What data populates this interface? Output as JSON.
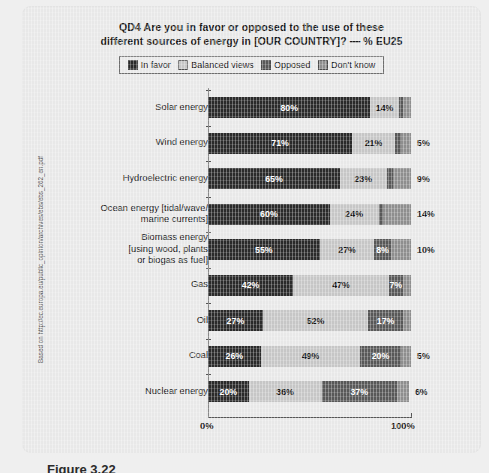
{
  "source_note": "Based on http://ec.europa.eu/public_opinion/archives/ebs/ebs_262_en.pdf",
  "figure_caption": "Figure 3.22",
  "title": {
    "line1": "QD4 Are you in favor or opposed to the use of these",
    "line2": "different sources of energy in [OUR COUNTRY]? — % EU25"
  },
  "legend": [
    {
      "label": "In favor",
      "color": "#2a2a2a"
    },
    {
      "label": "Balanced views",
      "color": "#c6c6c6"
    },
    {
      "label": "Opposed",
      "color": "#585858"
    },
    {
      "label": "Don't know",
      "color": "#8e8e8e"
    }
  ],
  "axis": {
    "min_label": "0%",
    "max_label": "100%"
  },
  "chart_data": {
    "type": "bar",
    "orientation": "horizontal",
    "stacked": true,
    "title": "QD4 Are you in favor or opposed to the use of these different sources of energy in [OUR COUNTRY]? — % EU25",
    "xlabel": "",
    "ylabel": "",
    "xlim": [
      0,
      100
    ],
    "grid": false,
    "legend_position": "top",
    "categories": [
      "Solar energy",
      "Wind energy",
      "Hydroelectric energy",
      "Ocean energy [tidal/wave/ marine currents]",
      "Biomass energy [using wood, plants or biogas as fuel]",
      "Gas",
      "Oil",
      "Coal",
      "Nuclear energy"
    ],
    "series": [
      {
        "name": "In favor",
        "values": [
          80,
          71,
          65,
          60,
          55,
          42,
          27,
          26,
          20
        ]
      },
      {
        "name": "Balanced views",
        "values": [
          14,
          21,
          23,
          24,
          27,
          47,
          52,
          49,
          36
        ]
      },
      {
        "name": "Opposed",
        "values": [
          2,
          3,
          3,
          2,
          8,
          7,
          17,
          20,
          37
        ]
      },
      {
        "name": "Don't know",
        "values": [
          4,
          5,
          9,
          14,
          10,
          4,
          4,
          5,
          6
        ]
      }
    ]
  },
  "rows": [
    {
      "label_lines": [
        "Solar energy"
      ],
      "segments": [
        {
          "key": "in_favor",
          "value": 80,
          "label": "80%",
          "show": true,
          "text_color": "#ffffff"
        },
        {
          "key": "balanced_views",
          "value": 14,
          "label": "14%",
          "show": true,
          "text_color": "#141414"
        },
        {
          "key": "opposed",
          "value": 2,
          "label": "2%",
          "show": false,
          "text_color": "#ffffff"
        },
        {
          "key": "dont_know",
          "value": 4,
          "label": "4%",
          "show": false,
          "text_color": "#141414"
        }
      ],
      "outside_label": ""
    },
    {
      "label_lines": [
        "Wind energy"
      ],
      "segments": [
        {
          "key": "in_favor",
          "value": 71,
          "label": "71%",
          "show": true,
          "text_color": "#ffffff"
        },
        {
          "key": "balanced_views",
          "value": 21,
          "label": "21%",
          "show": true,
          "text_color": "#141414"
        },
        {
          "key": "opposed",
          "value": 3,
          "label": "3%",
          "show": false,
          "text_color": "#ffffff"
        },
        {
          "key": "dont_know",
          "value": 5,
          "label": "5%",
          "show": false,
          "text_color": "#141414"
        }
      ],
      "outside_label": "5%"
    },
    {
      "label_lines": [
        "Hydroelectric energy"
      ],
      "segments": [
        {
          "key": "in_favor",
          "value": 65,
          "label": "65%",
          "show": true,
          "text_color": "#ffffff"
        },
        {
          "key": "balanced_views",
          "value": 23,
          "label": "23%",
          "show": true,
          "text_color": "#141414"
        },
        {
          "key": "opposed",
          "value": 3,
          "label": "3%",
          "show": false,
          "text_color": "#ffffff"
        },
        {
          "key": "dont_know",
          "value": 9,
          "label": "9%",
          "show": false,
          "text_color": "#141414"
        }
      ],
      "outside_label": "9%"
    },
    {
      "label_lines": [
        "Ocean energy [tidal/wave/",
        "marine currents]"
      ],
      "segments": [
        {
          "key": "in_favor",
          "value": 60,
          "label": "60%",
          "show": true,
          "text_color": "#ffffff"
        },
        {
          "key": "balanced_views",
          "value": 24,
          "label": "24%",
          "show": true,
          "text_color": "#141414"
        },
        {
          "key": "opposed",
          "value": 2,
          "label": "2%",
          "show": false,
          "text_color": "#ffffff"
        },
        {
          "key": "dont_know",
          "value": 14,
          "label": "14%",
          "show": false,
          "text_color": "#141414"
        }
      ],
      "outside_label": "14%"
    },
    {
      "label_lines": [
        "Biomass energy",
        "[using wood, plants",
        "or biogas as fuel]"
      ],
      "segments": [
        {
          "key": "in_favor",
          "value": 55,
          "label": "55%",
          "show": true,
          "text_color": "#ffffff"
        },
        {
          "key": "balanced_views",
          "value": 27,
          "label": "27%",
          "show": true,
          "text_color": "#141414"
        },
        {
          "key": "opposed",
          "value": 8,
          "label": "8%",
          "show": true,
          "text_color": "#ffffff"
        },
        {
          "key": "dont_know",
          "value": 10,
          "label": "10%",
          "show": false,
          "text_color": "#141414"
        }
      ],
      "outside_label": "10%"
    },
    {
      "label_lines": [
        "Gas"
      ],
      "segments": [
        {
          "key": "in_favor",
          "value": 42,
          "label": "42%",
          "show": true,
          "text_color": "#ffffff"
        },
        {
          "key": "balanced_views",
          "value": 47,
          "label": "47%",
          "show": true,
          "text_color": "#141414"
        },
        {
          "key": "opposed",
          "value": 7,
          "label": "7%",
          "show": true,
          "text_color": "#ffffff"
        },
        {
          "key": "dont_know",
          "value": 4,
          "label": "4%",
          "show": false,
          "text_color": "#141414"
        }
      ],
      "outside_label": ""
    },
    {
      "label_lines": [
        "Oil"
      ],
      "segments": [
        {
          "key": "in_favor",
          "value": 27,
          "label": "27%",
          "show": true,
          "text_color": "#ffffff"
        },
        {
          "key": "balanced_views",
          "value": 52,
          "label": "52%",
          "show": true,
          "text_color": "#141414"
        },
        {
          "key": "opposed",
          "value": 17,
          "label": "17%",
          "show": true,
          "text_color": "#ffffff"
        },
        {
          "key": "dont_know",
          "value": 4,
          "label": "4%",
          "show": false,
          "text_color": "#141414"
        }
      ],
      "outside_label": ""
    },
    {
      "label_lines": [
        "Coal"
      ],
      "segments": [
        {
          "key": "in_favor",
          "value": 26,
          "label": "26%",
          "show": true,
          "text_color": "#ffffff"
        },
        {
          "key": "balanced_views",
          "value": 49,
          "label": "49%",
          "show": true,
          "text_color": "#141414"
        },
        {
          "key": "opposed",
          "value": 20,
          "label": "20%",
          "show": true,
          "text_color": "#ffffff"
        },
        {
          "key": "dont_know",
          "value": 5,
          "label": "5%",
          "show": false,
          "text_color": "#141414"
        }
      ],
      "outside_label": "5%"
    },
    {
      "label_lines": [
        "Nuclear energy"
      ],
      "segments": [
        {
          "key": "in_favor",
          "value": 20,
          "label": "20%",
          "show": true,
          "text_color": "#ffffff"
        },
        {
          "key": "balanced_views",
          "value": 36,
          "label": "36%",
          "show": true,
          "text_color": "#141414"
        },
        {
          "key": "opposed",
          "value": 37,
          "label": "37%",
          "show": true,
          "text_color": "#ffffff"
        },
        {
          "key": "dont_know",
          "value": 6,
          "label": "6%",
          "show": false,
          "text_color": "#141414"
        }
      ],
      "outside_label": "6%"
    }
  ]
}
